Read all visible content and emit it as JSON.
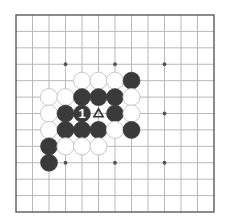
{
  "board": {
    "type": "go-diagram",
    "border": {
      "left": 16,
      "top": 15,
      "right": 214,
      "bottom": 212
    },
    "cell": 16.5,
    "cols": 13,
    "rows": 13,
    "colors": {
      "background": "#ffffff",
      "line": "#b8b8b8",
      "border": "#5a5a5a",
      "black": "#3a3a3a",
      "white_fill": "#ffffff",
      "white_edge": "#c8c8c8",
      "star": "#555555",
      "label": "#ffffff"
    },
    "star_points": [
      [
        3,
        3
      ],
      [
        6,
        3
      ],
      [
        9,
        3
      ],
      [
        3,
        6
      ],
      [
        9,
        6
      ],
      [
        3,
        9
      ],
      [
        6,
        9
      ],
      [
        9,
        9
      ]
    ],
    "stones": [
      {
        "color": "white",
        "col": 4,
        "row": 4
      },
      {
        "color": "white",
        "col": 5,
        "row": 4
      },
      {
        "color": "white",
        "col": 6,
        "row": 4
      },
      {
        "color": "black",
        "col": 7,
        "row": 4
      },
      {
        "color": "white",
        "col": 2,
        "row": 5
      },
      {
        "color": "white",
        "col": 3,
        "row": 5
      },
      {
        "color": "black",
        "col": 4,
        "row": 5
      },
      {
        "color": "black",
        "col": 5,
        "row": 5
      },
      {
        "color": "black",
        "col": 6,
        "row": 5
      },
      {
        "color": "white",
        "col": 7,
        "row": 5
      },
      {
        "color": "white",
        "col": 2,
        "row": 6
      },
      {
        "color": "black",
        "col": 3,
        "row": 6
      },
      {
        "color": "black",
        "col": 4,
        "row": 6,
        "label": "1"
      },
      {
        "color": "black",
        "col": 6,
        "row": 6
      },
      {
        "color": "white",
        "col": 7,
        "row": 6
      },
      {
        "color": "white",
        "col": 2,
        "row": 7
      },
      {
        "color": "black",
        "col": 3,
        "row": 7
      },
      {
        "color": "black",
        "col": 4,
        "row": 7
      },
      {
        "color": "black",
        "col": 5,
        "row": 7
      },
      {
        "color": "white",
        "col": 6,
        "row": 7
      },
      {
        "color": "black",
        "col": 7,
        "row": 7
      },
      {
        "color": "black",
        "col": 2,
        "row": 8
      },
      {
        "color": "white",
        "col": 3,
        "row": 8
      },
      {
        "color": "white",
        "col": 4,
        "row": 8
      },
      {
        "color": "white",
        "col": 5,
        "row": 8
      },
      {
        "color": "black",
        "col": 2,
        "row": 9
      }
    ],
    "markers": [
      {
        "type": "triangle",
        "symbol": "△",
        "col": 5,
        "row": 6
      }
    ]
  }
}
